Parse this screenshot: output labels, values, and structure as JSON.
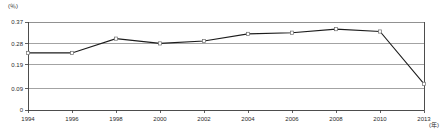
{
  "chart_data": {
    "type": "line",
    "title": "",
    "subtitle": "",
    "xlabel": "(年)",
    "ylabel": "(％)",
    "categories": [
      "1994",
      "1996",
      "1998",
      "2000",
      "2002",
      "2004",
      "2006",
      "2008",
      "2010",
      "2013"
    ],
    "values": [
      0.24,
      0.24,
      0.3,
      0.28,
      0.29,
      0.32,
      0.325,
      0.34,
      0.33,
      0.11
    ],
    "series": [
      {
        "name": "series-1",
        "values": [
          0.24,
          0.24,
          0.3,
          0.28,
          0.29,
          0.32,
          0.325,
          0.34,
          0.33,
          0.11
        ]
      }
    ],
    "ylim": [
      0,
      0.37
    ],
    "yticks": [
      0,
      0.09,
      0.19,
      0.28,
      0.37
    ],
    "ytick_labels": [
      "0",
      "0.09",
      "0.19",
      "0.28",
      "0.37"
    ],
    "xtick_labels": [
      "1994",
      "1996",
      "1998",
      "2000",
      "2002",
      "2004",
      "2006",
      "2008",
      "2010",
      "2013"
    ],
    "grid": true,
    "legend": "none",
    "marker": "open-square",
    "line_color": "#1c1c1c",
    "grid_color": "#8c8c8c",
    "axis_color": "#3a3a3a",
    "background": "#ffffff"
  },
  "axes": {
    "y_unit": "(％)",
    "x_unit": "(年)"
  }
}
